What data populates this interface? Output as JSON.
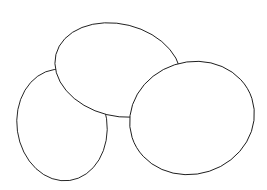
{
  "figure": {
    "colors": {
      "background": "#ffffff",
      "stroke": "#000000",
      "hatch": "#111111"
    },
    "ellipses": [
      {
        "name": "top",
        "cx": 115,
        "cy": 70,
        "rx": 63,
        "ry": 47,
        "rotate": 12
      },
      {
        "name": "left",
        "cx": 62,
        "cy": 125,
        "rx": 45,
        "ry": 57,
        "rotate": -8
      },
      {
        "name": "right",
        "cx": 190,
        "cy": 118,
        "rx": 63,
        "ry": 57,
        "rotate": -15
      }
    ]
  }
}
